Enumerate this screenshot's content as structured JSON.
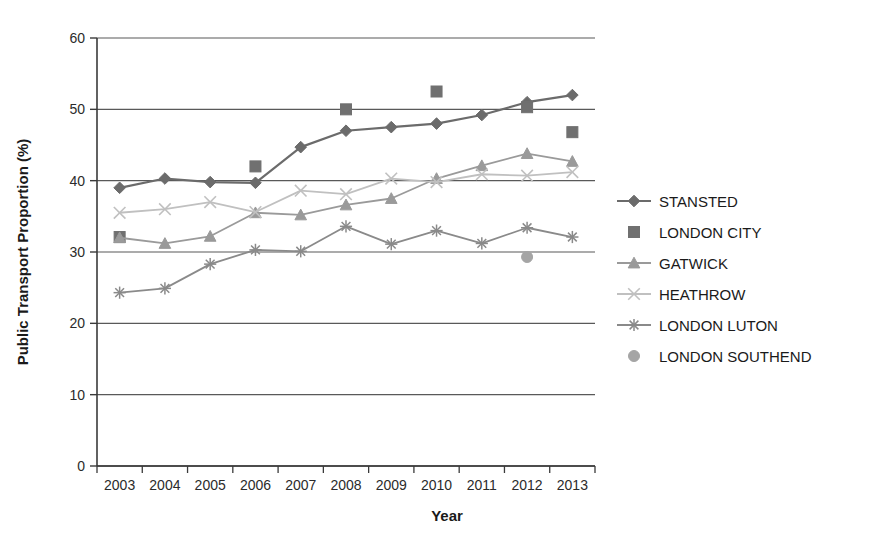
{
  "chart_data": {
    "type": "line",
    "title": "",
    "xlabel": "Year",
    "ylabel": "Public Transport Proportion (%)",
    "categories": [
      "2003",
      "2004",
      "2005",
      "2006",
      "2007",
      "2008",
      "2009",
      "2010",
      "2011",
      "2012",
      "2013"
    ],
    "ylim": [
      0,
      60
    ],
    "yticks": [
      0,
      10,
      20,
      30,
      40,
      50,
      60
    ],
    "grid": true,
    "legend_position": "right",
    "series": [
      {
        "name": "STANSTED",
        "marker": "diamond",
        "color": "#6b6b6b",
        "line": true,
        "values": [
          39.0,
          40.3,
          39.8,
          39.7,
          44.7,
          47.0,
          47.5,
          48.0,
          49.2,
          51.0,
          52.0
        ]
      },
      {
        "name": "LONDON CITY",
        "marker": "square",
        "color": "#707070",
        "line": false,
        "values": [
          32.1,
          null,
          null,
          42.0,
          null,
          50.0,
          null,
          52.5,
          null,
          50.3,
          46.8
        ]
      },
      {
        "name": "GATWICK",
        "marker": "triangle",
        "color": "#9a9a9a",
        "line": true,
        "values": [
          32.0,
          31.2,
          32.2,
          35.5,
          35.2,
          36.6,
          37.5,
          40.3,
          42.1,
          43.8,
          42.7
        ]
      },
      {
        "name": "HEATHROW",
        "marker": "x",
        "color": "#c0c0c0",
        "line": true,
        "values": [
          35.5,
          36.0,
          37.0,
          35.6,
          38.6,
          38.1,
          40.3,
          39.8,
          40.9,
          40.7,
          41.2
        ]
      },
      {
        "name": "LONDON LUTON",
        "marker": "asterisk",
        "color": "#8a8a8a",
        "line": true,
        "values": [
          24.3,
          24.9,
          28.3,
          30.3,
          30.1,
          33.6,
          31.1,
          33.0,
          31.2,
          33.4,
          32.1
        ]
      },
      {
        "name": "LONDON SOUTHEND",
        "marker": "circle",
        "color": "#a5a5a5",
        "line": false,
        "values": [
          null,
          null,
          null,
          null,
          null,
          null,
          null,
          null,
          null,
          29.3,
          null
        ]
      }
    ]
  },
  "legend": {
    "items": [
      {
        "label": "STANSTED"
      },
      {
        "label": "LONDON CITY"
      },
      {
        "label": "GATWICK"
      },
      {
        "label": "HEATHROW"
      },
      {
        "label": "LONDON LUTON"
      },
      {
        "label": "LONDON SOUTHEND"
      }
    ]
  }
}
